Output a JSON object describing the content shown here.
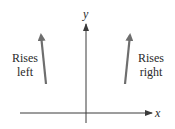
{
  "diagram": {
    "axes": {
      "x_label": "x",
      "y_label": "y",
      "color": "#3a3a3a"
    },
    "arrows": [
      {
        "name": "rises-left",
        "line1": "Rises",
        "line2": "left",
        "color": "#6e6e6e"
      },
      {
        "name": "rises-right",
        "line1": "Rises",
        "line2": "right",
        "color": "#6e6e6e"
      }
    ]
  }
}
